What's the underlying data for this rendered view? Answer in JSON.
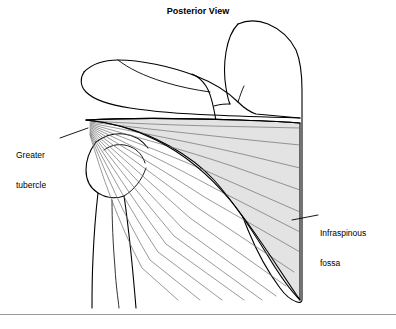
{
  "figure": {
    "title": "Posterior View",
    "labels": [
      {
        "id": "greater-tubercle",
        "line1": "Greater",
        "line2": "tubercle"
      },
      {
        "id": "infraspinous-fossa",
        "line1": "Infraspinous",
        "line2": "fossa"
      }
    ],
    "colors": {
      "outline": "#000000",
      "muscle_fill": "#e3e3e3",
      "muscle_fiber": "#6e6e6e",
      "background": "#ffffff",
      "border": "#9a9a9a"
    }
  }
}
